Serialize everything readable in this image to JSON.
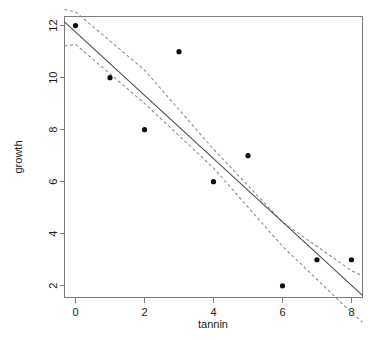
{
  "chart_data": {
    "type": "scatter",
    "title": "",
    "xlabel": "tannin",
    "ylabel": "growth",
    "x": [
      0,
      1,
      2,
      3,
      4,
      5,
      6,
      7,
      8
    ],
    "values": [
      12,
      10,
      8,
      11,
      6,
      7,
      2,
      3,
      3
    ],
    "series": [
      {
        "name": "observations",
        "type": "scatter",
        "x": [
          0,
          1,
          2,
          3,
          4,
          5,
          6,
          7,
          8
        ],
        "values": [
          12,
          10,
          8,
          11,
          6,
          7,
          2,
          3,
          3
        ]
      },
      {
        "name": "fitted regression line",
        "type": "line",
        "intercept": 11.756,
        "slope": -1.217,
        "x": [
          -0.32,
          8.32
        ],
        "values": [
          12.145,
          1.631
        ]
      },
      {
        "name": "upper confidence band",
        "type": "line",
        "x": [
          -0.32,
          0,
          2,
          4,
          6,
          8,
          8.32
        ],
        "values": [
          12.62,
          12.53,
          10.29,
          7.25,
          4.45,
          2.58,
          2.38
        ]
      },
      {
        "name": "lower confidence band",
        "type": "line",
        "x": [
          -0.32,
          0,
          2,
          4,
          6,
          8,
          8.32
        ],
        "values": [
          11.22,
          11.28,
          9.01,
          6.53,
          3.52,
          0.97,
          0.6
        ]
      }
    ],
    "xlim": [
      -0.32,
      8.32
    ],
    "ylim": [
      1.55,
      12.35
    ],
    "xticks": [
      "0",
      "2",
      "4",
      "6",
      "8"
    ],
    "xtick_values": [
      0,
      2,
      4,
      6,
      8
    ],
    "yticks": [
      "2",
      "4",
      "6",
      "8",
      "10",
      "12"
    ],
    "ytick_values": [
      2,
      4,
      6,
      8,
      10,
      12
    ],
    "grid": false,
    "legend": "none",
    "point_symbol": "filled-circle",
    "fit_line_style": "solid",
    "band_line_style": "dashed",
    "colors": {
      "point": "#0d0d0d",
      "fit_line": "#4d4d4d",
      "band_line": "#8a8a8a",
      "frame": "#7a7a7a",
      "text": "#1a1a1a",
      "background": "#ffffff"
    }
  }
}
